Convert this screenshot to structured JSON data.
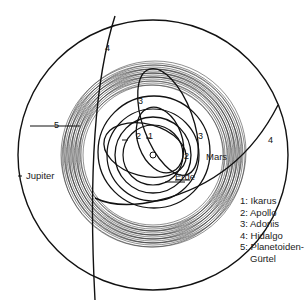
{
  "diagram": {
    "center": "Sonne",
    "planets": [
      {
        "label": "Erde"
      },
      {
        "label": "Mars"
      },
      {
        "label": "Jupiter"
      }
    ],
    "orbit_markers": [
      "1",
      "2",
      "2",
      "3",
      "3",
      "4",
      "4",
      "5"
    ],
    "legend": [
      {
        "key": "1",
        "text": "1: Ikarus"
      },
      {
        "key": "2",
        "text": "2: Apollo"
      },
      {
        "key": "3",
        "text": "3: Adonis"
      },
      {
        "key": "4",
        "text": "4: Hidalgo"
      },
      {
        "key": "5",
        "text": "5: Planetoiden-",
        "continuation": "Gürtel"
      }
    ]
  }
}
